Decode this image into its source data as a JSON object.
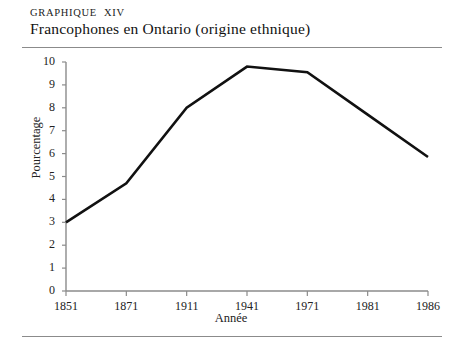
{
  "header": {
    "kicker_word": "GRAPHIQUE",
    "kicker_numeral": "XIV",
    "title": "Francophones en Ontario (origine ethnique)"
  },
  "chart_data": {
    "type": "line",
    "title": "Francophones en Ontario (origine ethnique)",
    "xlabel": "Année",
    "ylabel": "Pourcentage",
    "categories": [
      "1851",
      "1871",
      "1911",
      "1941",
      "1971",
      "1981",
      "1986"
    ],
    "values": [
      3.0,
      4.7,
      8.0,
      9.8,
      9.55,
      7.7,
      5.85
    ],
    "vertices": [
      "1851",
      "1871",
      "1911",
      "1941",
      "1971",
      "1986"
    ],
    "ylim": [
      0,
      10
    ],
    "ytick_labels": [
      "0",
      "1",
      "2",
      "3",
      "4",
      "5",
      "6",
      "7",
      "8",
      "9",
      "10"
    ],
    "grid": false,
    "legend": false,
    "line_color": "#111111",
    "axis_color": "#8b8b8b"
  }
}
